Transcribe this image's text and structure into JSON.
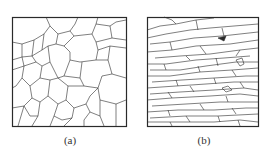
{
  "panels": [
    {
      "id": "a",
      "label": "(a)",
      "description": "equiaxed grains"
    },
    {
      "id": "b",
      "label": "(b)",
      "description": "elongated grains"
    }
  ],
  "colors": {
    "line": "#2a2a2a",
    "background": "#ffffff"
  }
}
